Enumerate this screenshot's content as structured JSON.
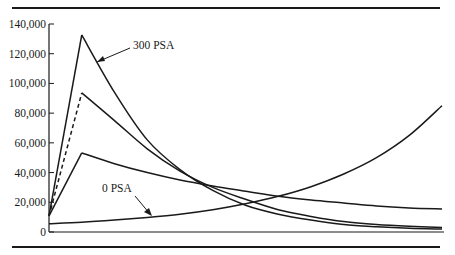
{
  "chart_data": {
    "type": "line",
    "title": "",
    "xlabel": "",
    "ylabel": "",
    "x_unit": "month",
    "xlim": [
      0,
      360
    ],
    "ylim": [
      0,
      140000
    ],
    "y_ticks": [
      0,
      20000,
      40000,
      60000,
      80000,
      100000,
      120000,
      140000
    ],
    "y_tick_labels": [
      "0",
      "20,000",
      "40,000",
      "60,000",
      "80,000",
      "100,000",
      "120,000",
      "140,000"
    ],
    "grid": false,
    "legend": "none (inline annotations)",
    "annotations": [
      {
        "text": "300 PSA",
        "points_to": "series 300 PSA, descending limb near month 40"
      },
      {
        "text": "0 PSA",
        "points_to": "series 0 PSA near month 100"
      }
    ],
    "series": [
      {
        "name": "300 PSA",
        "style": "solid",
        "x": [
          0,
          30,
          60,
          90,
          120,
          150,
          180,
          210,
          240,
          270,
          300,
          330,
          360
        ],
        "values": [
          10800,
          132600,
          94000,
          62000,
          42000,
          28000,
          18000,
          12000,
          8000,
          5000,
          3500,
          2500,
          2000
        ]
      },
      {
        "name": "Intermediate PSA",
        "style": "dashed ramp to peak, solid thereafter",
        "x": [
          0,
          30,
          60,
          90,
          120,
          150,
          180,
          210,
          240,
          270,
          300,
          330,
          360
        ],
        "values": [
          10800,
          93600,
          75000,
          56000,
          41000,
          30000,
          22000,
          15000,
          10500,
          7000,
          5000,
          3800,
          3000
        ]
      },
      {
        "name": "Lower PSA",
        "style": "solid",
        "x": [
          0,
          30,
          60,
          90,
          120,
          150,
          180,
          210,
          240,
          270,
          300,
          330,
          360
        ],
        "values": [
          10800,
          53200,
          46000,
          40000,
          35000,
          31000,
          27500,
          24000,
          21500,
          19500,
          17500,
          16200,
          15500
        ]
      },
      {
        "name": "0 PSA",
        "style": "solid",
        "x": [
          0,
          30,
          60,
          90,
          120,
          150,
          180,
          210,
          240,
          270,
          300,
          330,
          360
        ],
        "values": [
          5500,
          6500,
          8000,
          9800,
          12000,
          15000,
          19000,
          24000,
          30500,
          39000,
          50000,
          65000,
          85000
        ]
      }
    ]
  },
  "labels": {
    "annotation_300": "300 PSA",
    "annotation_0": "0 PSA"
  }
}
